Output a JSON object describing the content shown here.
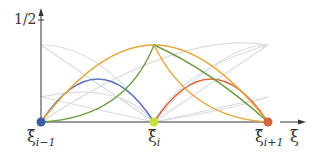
{
  "diagram": {
    "y_tick_label": "1/2",
    "x_axis_label": "ξ",
    "nodes": [
      {
        "label": "ξ̂",
        "sub": "i−1",
        "color": "#3f5ea8"
      },
      {
        "label": "ξ̂",
        "sub": "i",
        "color": "#c8e03a"
      },
      {
        "label": "ξ̂",
        "sub": "i+1",
        "color": "#d0663a"
      }
    ],
    "curves": [
      {
        "name": "blue",
        "color": "#5b74b8"
      },
      {
        "name": "orange",
        "color": "#e8a53a"
      },
      {
        "name": "green",
        "color": "#6e9e45"
      },
      {
        "name": "red",
        "color": "#d86a40"
      },
      {
        "name": "faint",
        "color": "#d6d9de"
      }
    ]
  }
}
